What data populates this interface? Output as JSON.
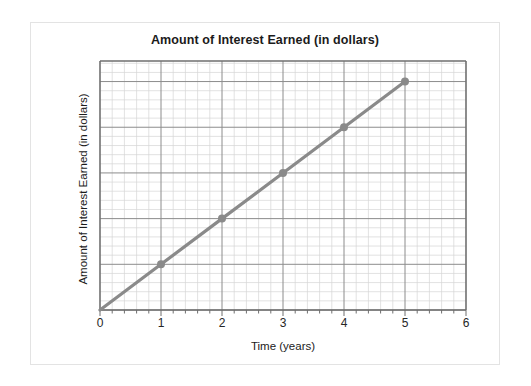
{
  "chart_data": {
    "type": "line",
    "title": "Amount of Interest Earned (in dollars)",
    "xlabel": "Time (years)",
    "ylabel": "Amount of Interest Earned (in dollars)",
    "x": [
      0,
      1,
      2,
      3,
      4,
      5
    ],
    "values": [
      0,
      1,
      2,
      3,
      4,
      5
    ],
    "marker_x": [
      1,
      2,
      3,
      4,
      5
    ],
    "marker_values": [
      1,
      2,
      3,
      4,
      5
    ],
    "xlim": [
      0,
      6
    ],
    "ylim": [
      0,
      5.45
    ],
    "x_ticks": [
      0,
      1,
      2,
      3,
      4,
      5,
      6
    ],
    "x_tick_labels": [
      "0",
      "1",
      "2",
      "3",
      "4",
      "5",
      "6"
    ],
    "y_tick_labels": [],
    "x_minor_step": 0.2,
    "x_major_step": 1,
    "y_minor_step": 0.2,
    "y_major_step": 1,
    "grid": true,
    "grid_minor": true,
    "legend": false,
    "series_color": "#8a8a8a",
    "grid_minor_color": "#d6d6d6",
    "grid_major_color": "#8c8c8c",
    "axis_color": "#6e6e6e",
    "background_color": "#ffffff",
    "frame_border_color": "#e3e3e3",
    "relationship": "direct variation — interest earned increases linearly with time"
  }
}
